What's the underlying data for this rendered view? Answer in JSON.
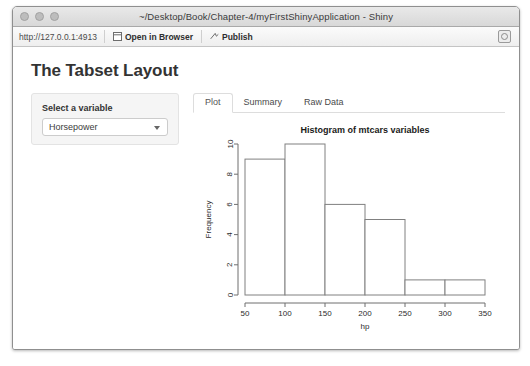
{
  "window": {
    "title": "~/Desktop/Book/Chapter-4/myFirstShinyApplication - Shiny",
    "traffic_lights": [
      "close",
      "minimize",
      "zoom"
    ]
  },
  "toolbar": {
    "url": "http://127.0.0.1:4913",
    "open_in_browser_label": "Open in Browser",
    "publish_label": "Publish",
    "refresh_icon": "refresh-icon"
  },
  "app": {
    "page_title": "The Tabset Layout",
    "sidebar": {
      "label": "Select a variable",
      "select": {
        "value": "Horsepower",
        "options": [
          "Horsepower"
        ]
      }
    },
    "tabs": [
      {
        "label": "Plot",
        "active": true
      },
      {
        "label": "Summary",
        "active": false
      },
      {
        "label": "Raw Data",
        "active": false
      }
    ]
  },
  "chart_data": {
    "type": "bar",
    "title": "Histogram of mtcars variables",
    "xlabel": "hp",
    "ylabel": "Frequency",
    "xlim": [
      50,
      350
    ],
    "ylim": [
      0,
      10
    ],
    "xticks": [
      50,
      100,
      150,
      200,
      250,
      300,
      350
    ],
    "yticks": [
      0,
      2,
      4,
      6,
      8,
      10
    ],
    "grid": false,
    "legend": null,
    "bin_width": 50,
    "bin_edges": [
      50,
      100,
      150,
      200,
      250,
      300,
      350
    ],
    "categories": [
      "50-100",
      "100-150",
      "150-200",
      "200-250",
      "250-300",
      "300-350"
    ],
    "values": [
      9,
      10,
      6,
      5,
      1,
      1
    ],
    "bar_fill": "#ffffff",
    "bar_stroke": "#808080"
  }
}
